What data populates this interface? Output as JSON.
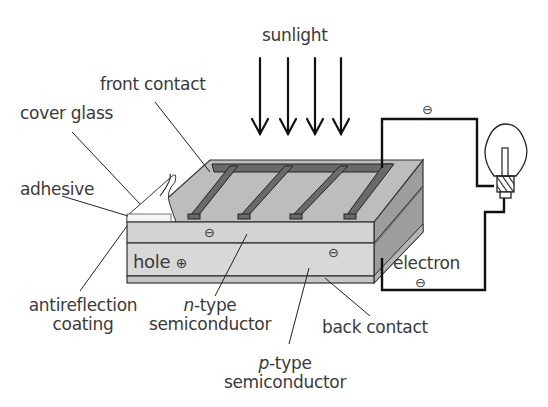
{
  "labels": {
    "sunlight": "sunlight",
    "front_contact": "front contact",
    "cover_glass": "cover glass",
    "adhesive": "adhesive",
    "antireflection_line1": "antireflection",
    "antireflection_line2": "coating",
    "n_type_prefix": "n",
    "n_type_suffix": "-type",
    "n_type_line2": "semiconductor",
    "p_type_prefix": "p",
    "p_type_suffix": "-type",
    "p_type_line2": "semiconductor",
    "back_contact": "back contact",
    "electron": "electron",
    "hole": "hole"
  },
  "symbols": {
    "electron_charge": "⊖",
    "hole_charge": "⊕"
  },
  "colors": {
    "top_face": "#b9b9b9",
    "front_contact": "#6a6a6a",
    "n_layer": "#d2d2d2",
    "p_layer": "#d6d6d6",
    "back_contact": "#c4c4c4",
    "side_face": "#9a9a9a",
    "wire": "#1a1a1a",
    "text": "#3a3a3a"
  },
  "sunlight_arrows": 4
}
